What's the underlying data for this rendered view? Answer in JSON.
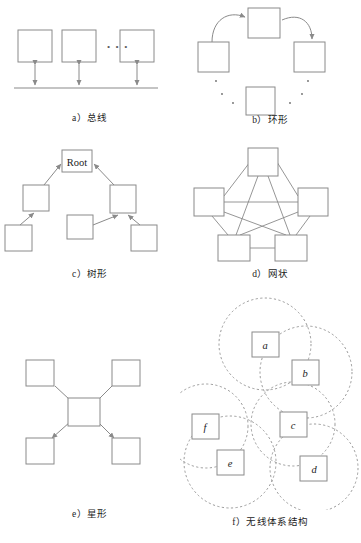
{
  "figure": {
    "width": 361,
    "height": 543,
    "background": "#ffffff",
    "stroke_color": "#8a8a8a",
    "dash_color": "#8a8a8a",
    "text_color": "#1c1c1c"
  },
  "panels": [
    {
      "id": "bus",
      "key": "a）",
      "label": "总线",
      "caption": "a）总线",
      "topology": "bus",
      "node_count": 3,
      "ellipsis": "• • •",
      "nodes": [
        {
          "name": "bus-node-1",
          "x": 18,
          "y": 30,
          "w": 34,
          "h": 32
        },
        {
          "name": "bus-node-2",
          "x": 62,
          "y": 30,
          "w": 34,
          "h": 32
        },
        {
          "name": "bus-node-3",
          "x": 120,
          "y": 30,
          "w": 34,
          "h": 32
        }
      ],
      "bus_line": {
        "x1": 14,
        "y1": 88,
        "x2": 158,
        "y2": 88
      }
    },
    {
      "id": "ring",
      "key": "b）",
      "label": "环形",
      "caption": "b）环形",
      "topology": "ring",
      "node_count": 4,
      "nodes": [
        {
          "name": "ring-node-top",
          "x": 68,
          "y": 8,
          "w": 32,
          "h": 30
        },
        {
          "name": "ring-node-left",
          "x": 18,
          "y": 42,
          "w": 31,
          "h": 30
        },
        {
          "name": "ring-node-right",
          "x": 114,
          "y": 42,
          "w": 31,
          "h": 30
        },
        {
          "name": "ring-node-bottom",
          "x": 66,
          "y": 87,
          "w": 29,
          "h": 28
        }
      ]
    },
    {
      "id": "tree",
      "key": "c）",
      "label": "树形",
      "caption": "c）树形",
      "topology": "tree",
      "root_label": "Root",
      "node_count": 6,
      "nodes": [
        {
          "name": "tree-node-root",
          "x": 62,
          "y": 10,
          "w": 30,
          "h": 22,
          "text": "Root"
        },
        {
          "name": "tree-node-left",
          "x": 23,
          "y": 45,
          "w": 26,
          "h": 26
        },
        {
          "name": "tree-node-right",
          "x": 110,
          "y": 45,
          "w": 26,
          "h": 28
        },
        {
          "name": "tree-node-leaf-left",
          "x": 5,
          "y": 85,
          "w": 27,
          "h": 26
        },
        {
          "name": "tree-node-leaf-mid",
          "x": 67,
          "y": 75,
          "w": 26,
          "h": 24
        },
        {
          "name": "tree-node-leaf-right",
          "x": 131,
          "y": 85,
          "w": 26,
          "h": 26
        }
      ]
    },
    {
      "id": "mesh",
      "key": "d）",
      "label": "网状",
      "caption": "d）网状",
      "topology": "mesh",
      "node_count": 5,
      "fully_connected": true,
      "edge_count": 10,
      "nodes": [
        {
          "name": "mesh-node-top",
          "x": 68,
          "y": 8,
          "w": 30,
          "h": 28
        },
        {
          "name": "mesh-node-left",
          "x": 14,
          "y": 48,
          "w": 30,
          "h": 28
        },
        {
          "name": "mesh-node-right",
          "x": 118,
          "y": 48,
          "w": 30,
          "h": 28
        },
        {
          "name": "mesh-node-bottom-left",
          "x": 38,
          "y": 95,
          "w": 32,
          "h": 26
        },
        {
          "name": "mesh-node-bottom-right",
          "x": 95,
          "y": 95,
          "w": 32,
          "h": 26
        }
      ]
    },
    {
      "id": "star",
      "key": "e）",
      "label": "星形",
      "caption": "e）星形",
      "topology": "star",
      "node_count": 5,
      "nodes": [
        {
          "name": "star-node-center",
          "x": 68,
          "y": 106,
          "w": 32,
          "h": 28
        },
        {
          "name": "star-node-top-left",
          "x": 26,
          "y": 68,
          "w": 28,
          "h": 26
        },
        {
          "name": "star-node-top-right",
          "x": 112,
          "y": 68,
          "w": 28,
          "h": 26
        },
        {
          "name": "star-node-bottom-left",
          "x": 26,
          "y": 146,
          "w": 28,
          "h": 26
        },
        {
          "name": "star-node-bottom-right",
          "x": 112,
          "y": 146,
          "w": 28,
          "h": 26
        }
      ]
    },
    {
      "id": "wireless",
      "key": "f）",
      "label": "无线体系结构",
      "caption": "f）无线体系结构",
      "topology": "wireless-coverage",
      "node_count": 6,
      "coverage_style": "dashed-circle",
      "nodes": [
        {
          "name": "wireless-node-a",
          "label": "a",
          "x": 72,
          "y": 40,
          "w": 27,
          "h": 25,
          "radius": 46
        },
        {
          "name": "wireless-node-b",
          "label": "b",
          "x": 112,
          "y": 68,
          "w": 27,
          "h": 25,
          "radius": 46
        },
        {
          "name": "wireless-node-c",
          "label": "c",
          "x": 100,
          "y": 120,
          "w": 27,
          "h": 25,
          "radius": 42
        },
        {
          "name": "wireless-node-d",
          "label": "d",
          "x": 120,
          "y": 164,
          "w": 27,
          "h": 25,
          "radius": 44
        },
        {
          "name": "wireless-node-e",
          "label": "e",
          "x": 37,
          "y": 158,
          "w": 27,
          "h": 25,
          "radius": 46
        },
        {
          "name": "wireless-node-f",
          "label": "f",
          "x": 12,
          "y": 122,
          "w": 27,
          "h": 25,
          "radius": 42
        }
      ]
    }
  ]
}
